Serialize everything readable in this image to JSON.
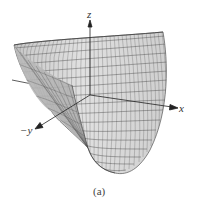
{
  "figure": {
    "caption": "(a)",
    "axes": {
      "z": "z",
      "x": "x",
      "neg_y": "−y"
    },
    "colors": {
      "surface_fill": "#d9d9d9",
      "surface_fill_dark": "#bdbdbd",
      "mesh_line": "#555555",
      "axis": "#333333",
      "background": "#ffffff"
    }
  }
}
